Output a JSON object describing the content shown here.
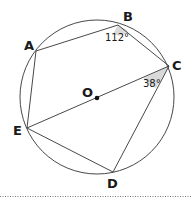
{
  "diagram": {
    "type": "circle-inscribed-pentagon",
    "center": {
      "label": "O"
    },
    "vertices": [
      {
        "label": "A"
      },
      {
        "label": "B"
      },
      {
        "label": "C"
      },
      {
        "label": "D"
      },
      {
        "label": "E"
      }
    ],
    "angles": [
      {
        "at": "B",
        "value": "112°"
      },
      {
        "at": "C",
        "value": "38°"
      }
    ],
    "segments": [
      "AB",
      "BC",
      "CD",
      "DE",
      "EA",
      "EC"
    ],
    "colors": {
      "stroke": "#333333",
      "angle_fill": "#d9d9d9",
      "text": "#1a1a1a"
    }
  }
}
